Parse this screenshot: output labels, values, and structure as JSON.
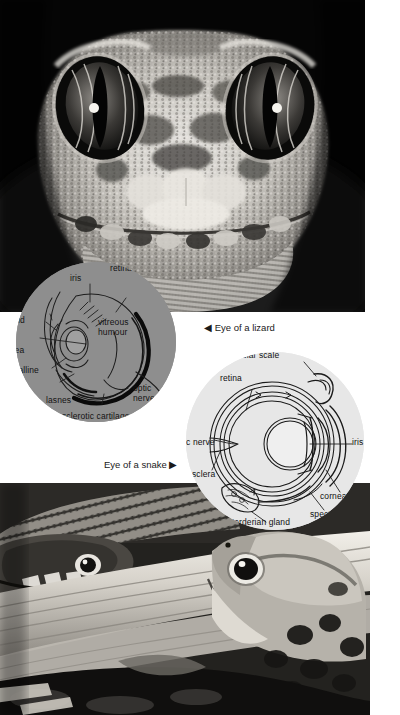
{
  "page": {
    "background": "#ffffff",
    "width": 400,
    "height": 715
  },
  "photos": {
    "lizard": {
      "name": "photograph of lizard head",
      "subject": "Gecko head facing camera, close-up, black and white",
      "alt": "Close-up black-and-white photograph of a gecko's head showing two large eyes with vertical pupils and granular scaled skin"
    },
    "snake_frog": {
      "name": "photograph of snake and frog",
      "subject": "Snake and frog on a fallen log, black and white",
      "alt": "Black-and-white photograph of a snake on the left and a leopard frog on the right resting on weathered driftwood"
    }
  },
  "diagrams": {
    "lizard_eye": {
      "title": "Eye of a lizard",
      "background_color": "#8e8e8e",
      "labels": [
        {
          "id": "retina",
          "text": "retina"
        },
        {
          "id": "iris",
          "text": "iris"
        },
        {
          "id": "eyelid",
          "text": "eyelid"
        },
        {
          "id": "vitreous-humour",
          "text": "vitreous\nhumour"
        },
        {
          "id": "cornea",
          "text": "ornea"
        },
        {
          "id": "crystalline-lens",
          "text": "crystalline\nlens"
        },
        {
          "id": "lasnes",
          "text": "lasnes"
        },
        {
          "id": "sclerotic-cartilage",
          "text": "sclerotic cartilage"
        },
        {
          "id": "optic-nerve",
          "text": "optic\nnerve"
        }
      ]
    },
    "snake_eye": {
      "title": "Eye of a snake",
      "background_color": "#e7e7e7",
      "labels": [
        {
          "id": "supra-ocular-scale",
          "text": "supra-ocular scale"
        },
        {
          "id": "retina",
          "text": "retina"
        },
        {
          "id": "iris",
          "text": "iris"
        },
        {
          "id": "optic-nerve",
          "text": "optic nerve"
        },
        {
          "id": "sclera",
          "text": "sclera"
        },
        {
          "id": "cornea",
          "text": "cornea"
        },
        {
          "id": "spectacle",
          "text": "spectacle"
        },
        {
          "id": "harderian-gland",
          "text": "Harderian gland"
        }
      ]
    }
  },
  "captions": {
    "lizard": "◀ Eye of a lizard",
    "snake": "Eye of a snake ▶"
  }
}
